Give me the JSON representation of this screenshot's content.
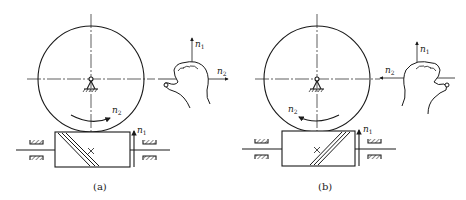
{
  "figure": {
    "panels": [
      {
        "id": "a",
        "caption": "(a)",
        "gear_label": "n",
        "gear_label_sub": "2",
        "worm_label": "n",
        "worm_label_sub": "1",
        "hand": {
          "type": "right-hand",
          "axis_up_label": "n",
          "axis_up_sub": "1",
          "axis_side_label": "n",
          "axis_side_sub": "2",
          "side_arrow_direction": "right"
        },
        "worm_thread_direction": "right-hand"
      },
      {
        "id": "b",
        "caption": "(b)",
        "gear_label": "n",
        "gear_label_sub": "2",
        "worm_label": "n",
        "worm_label_sub": "1",
        "hand": {
          "type": "left-hand",
          "axis_up_label": "n",
          "axis_up_sub": "1",
          "axis_side_label": "n",
          "axis_side_sub": "2",
          "side_arrow_direction": "left"
        },
        "worm_thread_direction": "left-hand"
      }
    ],
    "colors": {
      "line": "#1a1a1a",
      "background": "#ffffff"
    }
  }
}
